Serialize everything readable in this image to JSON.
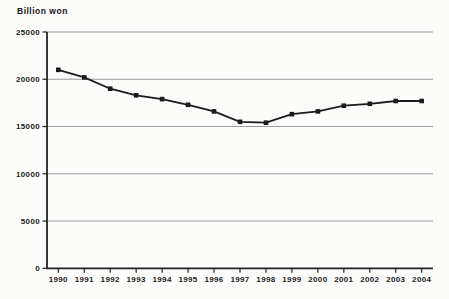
{
  "chart_data": {
    "type": "line",
    "title": "Billion won",
    "xlabel": "",
    "ylabel": "Billion won",
    "x": [
      1990,
      1991,
      1992,
      1993,
      1994,
      1995,
      1996,
      1997,
      1998,
      1999,
      2000,
      2001,
      2002,
      2003,
      2004
    ],
    "series": [
      {
        "name": "Value (billion won)",
        "values": [
          21000,
          20200,
          19000,
          18300,
          17900,
          17300,
          16600,
          15500,
          15400,
          16300,
          16600,
          17200,
          17400,
          17700,
          17700
        ]
      }
    ],
    "ylim": [
      0,
      25000
    ],
    "yticks": [
      0,
      5000,
      10000,
      15000,
      20000,
      25000
    ],
    "grid": "horizontal",
    "legend": "none",
    "marker": "square",
    "colors": {
      "line": "#1b1b1b",
      "marker": "#1b1b1b",
      "grid": "#9b9b9b",
      "axis": "#222222",
      "text": "#222222",
      "background": "#fcfcfb"
    }
  }
}
